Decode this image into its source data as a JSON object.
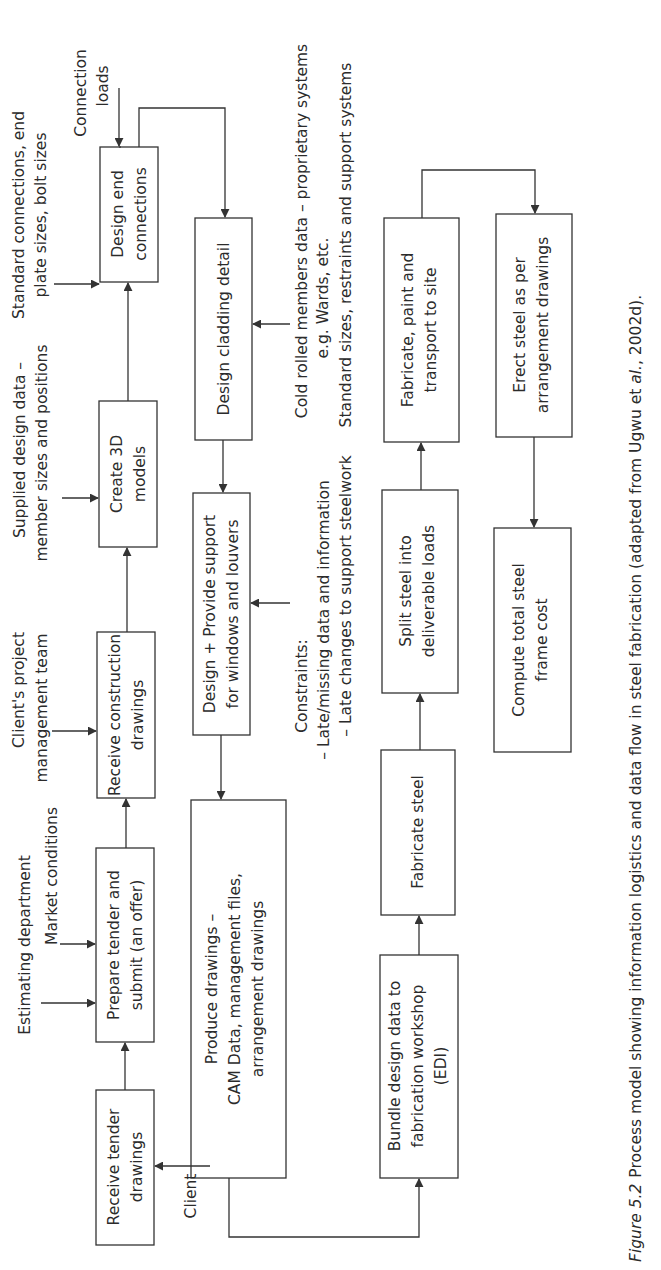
{
  "figure": {
    "caption_label": "Figure 5.2",
    "caption_text": "Process model showing information logistics and data flow in steel fabrication (adapted from Ugwu et ",
    "caption_italic": "al.",
    "caption_end": ", 2002d).",
    "orientation": "rotated 90° counter-clockwise"
  },
  "process_boxes": {
    "receive_tender": {
      "line1": "Receive tender",
      "line2": "drawings"
    },
    "prepare_tender": {
      "line1": "Prepare tender and",
      "line2": "submit (an offer)"
    },
    "receive_construction": {
      "line1": "Receive construction",
      "line2": "drawings"
    },
    "create_3d": {
      "line1": "Create 3D",
      "line2": "models"
    },
    "design_end": {
      "line1": "Design end",
      "line2": "connections"
    },
    "design_cladding": {
      "line1": "Design cladding detail"
    },
    "design_support": {
      "line1": "Design + Provide support",
      "line2": "for windows and louvers"
    },
    "produce_drawings": {
      "line1": "Produce drawings –",
      "line2": "CAM Data, management files,",
      "line3": "arrangement drawings"
    },
    "bundle_design": {
      "line1": "Bundle design data to",
      "line2": "fabrication workshop",
      "line3": "(EDI)"
    },
    "fabricate_steel": {
      "line1": "Fabricate steel"
    },
    "split_steel": {
      "line1": "Split steel into",
      "line2": "deliverable loads"
    },
    "fabricate_paint": {
      "line1": "Fabricate, paint and",
      "line2": "transport to site"
    },
    "erect_steel": {
      "line1": "Erect steel as per",
      "line2": "arrangement drawings"
    },
    "compute_cost": {
      "line1": "Compute total steel",
      "line2": "frame cost"
    }
  },
  "inputs": {
    "client": "Client",
    "estimating": "Estimating department",
    "market": "Market conditions",
    "clients_pm_1": "Client's project",
    "clients_pm_2": "management team",
    "supplied_1": "Supplied design data –",
    "supplied_2": "member sizes and positions",
    "standard_conn_1": "Standard connections, end",
    "standard_conn_2": "plate sizes, bolt sizes",
    "conn_loads_1": "Connection",
    "conn_loads_2": "loads",
    "cold_rolled_1": "Cold rolled members data – proprietary systems",
    "cold_rolled_2": "e.g. Wards, etc.",
    "standard_sizes": "Standard sizes, restraints and support systems",
    "constraints_title": "Constraints:",
    "constraint_1": "– Late/missing data and information",
    "constraint_2": "– Late changes to support steelwork"
  },
  "colors": {
    "line": "#333333",
    "text": "#2b2b2b",
    "background": "#ffffff"
  }
}
